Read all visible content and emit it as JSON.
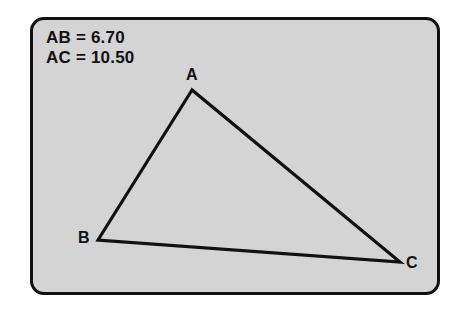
{
  "figure": {
    "type": "geometry-diagram",
    "background_color": "#ffffff",
    "panel_fill_color": "#d4d4d4",
    "border_color": "#111111",
    "stroke_color": "#111111"
  },
  "measurements": [
    {
      "label": "AB = 6.70"
    },
    {
      "label": "AC = 10.50"
    }
  ],
  "triangle": {
    "vertices": [
      {
        "name": "A",
        "label": "A",
        "x": 192,
        "y": 90
      },
      {
        "name": "B",
        "label": "B",
        "x": 98,
        "y": 240
      },
      {
        "name": "C",
        "label": "C",
        "x": 400,
        "y": 262
      }
    ],
    "sides": [
      {
        "name": "AB",
        "from": "A",
        "to": "B"
      },
      {
        "name": "AC",
        "from": "A",
        "to": "C"
      },
      {
        "name": "BC",
        "from": "B",
        "to": "C"
      }
    ]
  }
}
